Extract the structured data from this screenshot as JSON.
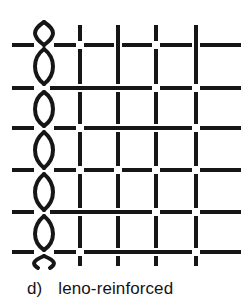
{
  "figure": {
    "id": "leno-weave-diagram",
    "caption_label": "d)",
    "caption_text": "leno-reinforced",
    "caption_full": "d)  leno-reinforced",
    "alt": "Schematic of a leno-reinforced plain weave: paired warp yarns twisting around one another at the left selvedge, straight warp yarns to the right, crossed by horizontal weft yarns"
  },
  "style": {
    "thread_color": "#161616",
    "background_color": "#ffffff",
    "thread_width_px": 4,
    "leno_thread_width_px": 4
  },
  "geometry": {
    "canvas_width": 252,
    "canvas_height": 272,
    "weft_x_start": 12,
    "weft_x_end": 241,
    "warp_y_start": 25,
    "warp_y_end": 266,
    "gap_px": 7
  },
  "weave": {
    "type": "plain-weave-with-leno-selvedge",
    "warp_label": "warp (vertical yarns)",
    "weft_label": "weft (horizontal yarns)",
    "leno_column_label": "leno doup pair",
    "warp_x_positions": [
      80,
      118,
      156,
      196
    ],
    "weft_y_positions": [
      45,
      88,
      128,
      170,
      212,
      252
    ],
    "weft_phase": [
      "over",
      "under",
      "over",
      "under",
      "over",
      "under"
    ],
    "leno": {
      "center_x": 44,
      "amplitude": 12,
      "period": 42,
      "y_start": 22,
      "y_end": 268,
      "twist_count": 6
    }
  }
}
